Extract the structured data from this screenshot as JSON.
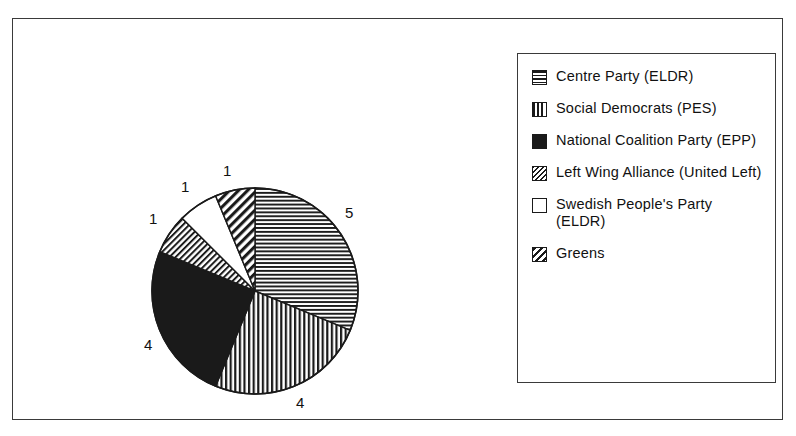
{
  "chart_data": {
    "type": "pie",
    "title": "",
    "subtitle": "",
    "xlabel": "",
    "ylabel": "",
    "total": 16,
    "units": "seats",
    "legend_position": "right",
    "grid": false,
    "start_angle_deg": 0,
    "direction": "clockwise",
    "categories": [
      "Centre Party (ELDR)",
      "Social Democrats (PES)",
      "National Coalition Party (EPP)",
      "Left Wing Alliance (United Left)",
      "Swedish People's Party (ELDR)",
      "Greens"
    ],
    "values": [
      5,
      4,
      4,
      1,
      1,
      1
    ],
    "slices": [
      {
        "label": "Centre Party (ELDR)",
        "value": 5,
        "value_text": "5",
        "pattern": "horizontal-stripes",
        "start_deg": 0,
        "end_deg": 112.5
      },
      {
        "label": "Social Democrats (PES)",
        "value": 4,
        "value_text": "4",
        "pattern": "vertical-stripes",
        "start_deg": 112.5,
        "end_deg": 202.5
      },
      {
        "label": "National Coalition Party (EPP)",
        "value": 4,
        "value_text": "4",
        "pattern": "solid-black",
        "start_deg": 202.5,
        "end_deg": 292.5
      },
      {
        "label": "Left Wing Alliance (United Left)",
        "value": 1,
        "value_text": "1",
        "pattern": "diagonal-fine",
        "start_deg": 292.5,
        "end_deg": 315
      },
      {
        "label": "Swedish People's Party (ELDR)",
        "value": 1,
        "value_text": "1",
        "pattern": "white",
        "start_deg": 315,
        "end_deg": 337.5
      },
      {
        "label": "Greens",
        "value": 1,
        "value_text": "1",
        "pattern": "diagonal-coarse",
        "start_deg": 337.5,
        "end_deg": 360
      }
    ],
    "colors": {
      "ink": "#1a1a1a",
      "background": "#ffffff",
      "frame": "#3a3a3a"
    }
  },
  "legend": {
    "items": [
      {
        "label": "Centre Party (ELDR)",
        "pattern": "horizontal-stripes"
      },
      {
        "label": "Social Democrats (PES)",
        "pattern": "vertical-stripes"
      },
      {
        "label": "National Coalition Party (EPP)",
        "pattern": "solid-black"
      },
      {
        "label": "Left Wing Alliance (United Left)",
        "pattern": "diagonal-fine"
      },
      {
        "label": "Swedish People's Party (ELDR)",
        "pattern": "white"
      },
      {
        "label": "Greens",
        "pattern": "diagonal-coarse"
      }
    ]
  },
  "pie_labels": [
    {
      "text": "5",
      "left": 332,
      "top": 186
    },
    {
      "text": "4",
      "left": 283,
      "top": 376
    },
    {
      "text": "4",
      "left": 131,
      "top": 318
    },
    {
      "text": "1",
      "left": 136,
      "top": 192
    },
    {
      "text": "1",
      "left": 168,
      "top": 160
    },
    {
      "text": "1",
      "left": 210,
      "top": 144
    }
  ]
}
